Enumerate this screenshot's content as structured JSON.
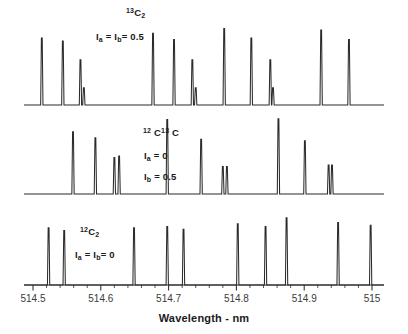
{
  "figure": {
    "kind": "spectrum-stack",
    "axis_title": "Wavelength - nm",
    "line_color": "#2b2b2b",
    "background": "#ffffff"
  },
  "axis": {
    "xlabel": "Wavelength - nm",
    "tick_labels": [
      "514.5",
      "514.6",
      "514.7",
      "514.8",
      "514.9",
      "515"
    ],
    "tick_values": [
      514.5,
      514.6,
      514.7,
      514.8,
      514.9,
      515.0
    ],
    "xlim": [
      514.47,
      515.02
    ]
  },
  "panels": [
    {
      "id": "panel-top",
      "species_label": "13C2",
      "species_html": "<sup>13</sup>C<sub>2</sub>",
      "spin_label": "Ia = Ib = 0.5",
      "spin_html": "I<sub>a</sub> = I<sub>b</sub>= 0.5"
    },
    {
      "id": "panel-middle",
      "species_label": "12C 13C",
      "species_html": "<sup>12</sup> C<sup>13</sup> C",
      "spin_label_1": "Ia = 0",
      "spin_html_1": "I<sub>a</sub> = 0",
      "spin_label_2": "Ib = 0.5",
      "spin_html_2": "I<sub>b</sub> = 0.5"
    },
    {
      "id": "panel-bottom",
      "species_label": "12C2",
      "species_html": "<sup>12</sup>C<sub>2</sub>",
      "spin_label": "Ia = Ib = 0",
      "spin_html": "I<sub>a</sub> = I<sub>b</sub>= 0"
    }
  ],
  "chart_data": {
    "type": "line",
    "title": "",
    "xlabel": "Wavelength - nm",
    "ylabel": "",
    "xlim": [
      514.47,
      515.02
    ],
    "grid": false,
    "legend_position": "none",
    "xticks": [
      514.5,
      514.6,
      514.7,
      514.8,
      514.9,
      515.0
    ],
    "xticklabels": [
      "514.5",
      "514.6",
      "514.7",
      "514.8",
      "514.9",
      "515"
    ],
    "series": [
      {
        "name": "13C2  Ia = Ib = 0.5",
        "panel": "top",
        "annotations": [
          "13C2",
          "Ia = Ib = 0.5"
        ],
        "peaks": [
          {
            "x": 514.513,
            "height": 0.86
          },
          {
            "x": 514.544,
            "height": 0.82
          },
          {
            "x": 514.57,
            "height": 0.58
          },
          {
            "x": 514.575,
            "height": 0.22
          },
          {
            "x": 514.677,
            "height": 0.92
          },
          {
            "x": 514.708,
            "height": 0.84
          },
          {
            "x": 514.735,
            "height": 0.58
          },
          {
            "x": 514.74,
            "height": 0.22
          },
          {
            "x": 514.782,
            "height": 0.98
          },
          {
            "x": 514.822,
            "height": 0.86
          },
          {
            "x": 514.85,
            "height": 0.58
          },
          {
            "x": 514.854,
            "height": 0.22
          },
          {
            "x": 514.925,
            "height": 0.96
          },
          {
            "x": 514.966,
            "height": 0.84
          }
        ]
      },
      {
        "name": "12C 13C  Ia = 0, Ib = 0.5",
        "panel": "middle",
        "annotations": [
          "12C 13C",
          "Ia = 0",
          "Ib = 0.5"
        ],
        "peaks": [
          {
            "x": 514.559,
            "height": 0.82
          },
          {
            "x": 514.592,
            "height": 0.74
          },
          {
            "x": 514.62,
            "height": 0.48
          },
          {
            "x": 514.627,
            "height": 0.5
          },
          {
            "x": 514.698,
            "height": 0.98
          },
          {
            "x": 514.748,
            "height": 0.72
          },
          {
            "x": 514.78,
            "height": 0.36
          },
          {
            "x": 514.786,
            "height": 0.36
          },
          {
            "x": 514.862,
            "height": 0.99
          },
          {
            "x": 514.901,
            "height": 0.7
          },
          {
            "x": 514.936,
            "height": 0.38
          },
          {
            "x": 514.941,
            "height": 0.38
          }
        ]
      },
      {
        "name": "12C2  Ia = Ib = 0",
        "panel": "bottom",
        "annotations": [
          "12C2",
          "Ia = Ib = 0"
        ],
        "peaks": [
          {
            "x": 514.523,
            "height": 0.84
          },
          {
            "x": 514.546,
            "height": 0.8
          },
          {
            "x": 514.649,
            "height": 0.84
          },
          {
            "x": 514.698,
            "height": 0.86
          },
          {
            "x": 514.722,
            "height": 0.82
          },
          {
            "x": 514.802,
            "height": 0.9
          },
          {
            "x": 514.843,
            "height": 0.86
          },
          {
            "x": 514.874,
            "height": 0.99
          },
          {
            "x": 514.95,
            "height": 0.92
          },
          {
            "x": 514.998,
            "height": 0.88
          }
        ]
      }
    ]
  }
}
